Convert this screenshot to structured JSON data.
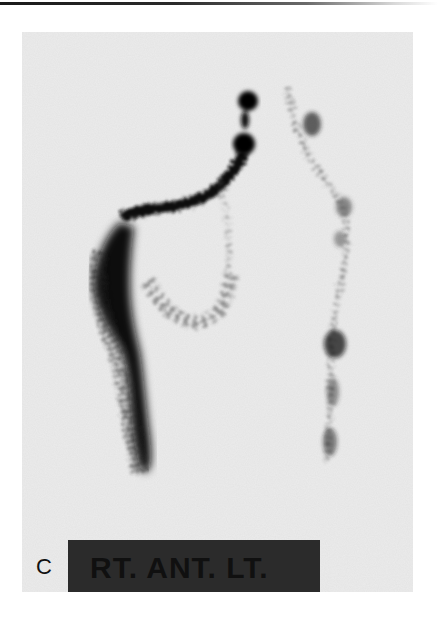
{
  "figure": {
    "panel_letter": "C",
    "view_label": "RT. ANT. LT.",
    "colors": {
      "background": "#ececec",
      "uptake": "#0a0a0a",
      "label_box": "#2b2b2b",
      "label_text": "#101010"
    }
  }
}
